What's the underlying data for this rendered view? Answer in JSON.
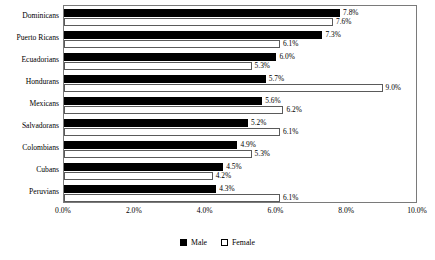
{
  "chart_data": {
    "type": "bar",
    "orientation": "horizontal",
    "title": "",
    "xlabel": "",
    "ylabel": "",
    "categories": [
      "Dominicans",
      "Puerto Ricans",
      "Ecuadorians",
      "Hondurans",
      "Mexicans",
      "Salvadorans",
      "Colombians",
      "Cubans",
      "Peruvians"
    ],
    "series": [
      {
        "name": "Male",
        "color": "#000000",
        "values": [
          7.8,
          7.3,
          6.0,
          5.7,
          5.6,
          5.2,
          4.9,
          4.5,
          4.3
        ]
      },
      {
        "name": "Female",
        "color": "#ffffff",
        "values": [
          7.6,
          6.1,
          5.3,
          9.0,
          6.2,
          6.1,
          5.3,
          4.2,
          6.1
        ]
      }
    ],
    "value_labels": {
      "Male": [
        "7.8%",
        "7.3%",
        "6.0%",
        "5.7%",
        "5.6%",
        "5.2%",
        "4.9%",
        "4.5%",
        "4.3%"
      ],
      "Female": [
        "7.6%",
        "6.1%",
        "5.3%",
        "9.0%",
        "6.2%",
        "6.1%",
        "5.3%",
        "4.2%",
        "6.1%"
      ]
    },
    "xlim": [
      0.0,
      10.0
    ],
    "xticks": [
      0.0,
      2.0,
      4.0,
      6.0,
      8.0,
      10.0
    ],
    "xtick_labels": [
      "0.0%",
      "2.0%",
      "4.0%",
      "6.0%",
      "8.0%",
      "10.0%"
    ],
    "grid": false,
    "legend_position": "bottom",
    "legend": [
      "Male",
      "Female"
    ]
  }
}
